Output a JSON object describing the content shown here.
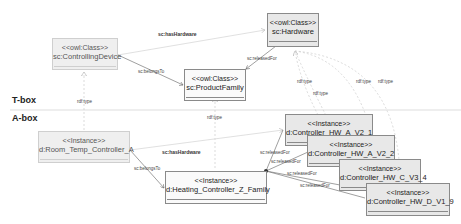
{
  "sections": {
    "tbox_label": "T-box",
    "abox_label": "A-box"
  },
  "tbox": {
    "classes": [
      {
        "id": "controlling_device",
        "stereotype": "<<owl:Class>>",
        "name": "sc:ControllingDevice"
      },
      {
        "id": "product_family",
        "stereotype": "<<owl:Class>>",
        "name": "sc:ProductFamily"
      },
      {
        "id": "hardware",
        "stereotype": "<<owl:Class>>",
        "name": "sc:Hardware"
      }
    ],
    "edges": [
      {
        "from": "controlling_device",
        "to": "hardware",
        "label": "sc:hasHardware"
      },
      {
        "from": "controlling_device",
        "to": "product_family",
        "label": "sc:belongsTo"
      },
      {
        "from": "hardware",
        "to": "product_family",
        "label": "sc:releasedFor"
      }
    ]
  },
  "abox": {
    "instances": [
      {
        "id": "room_temp",
        "stereotype": "<<Instance>>",
        "name": "d:Room_Temp_Controller_A"
      },
      {
        "id": "heating_family",
        "stereotype": "<<Instance>>",
        "name": "d:Heating_Controller_Z_Family"
      },
      {
        "id": "hw_a_v2_1",
        "stereotype": "<<Instance>>",
        "name": "d:Controller_HW_A_V2_1"
      },
      {
        "id": "hw_a_v2_2",
        "stereotype": "<<Instance>>",
        "name": "d:Controller_HW_A_V2_2"
      },
      {
        "id": "hw_c_v3_4",
        "stereotype": "<<Instance>>",
        "name": "d:Controller_HW_C_V3_4"
      },
      {
        "id": "hw_d_v1_9",
        "stereotype": "<<Instance>>",
        "name": "d:Controller_HW_D_V1_9"
      }
    ],
    "edges": [
      {
        "from": "room_temp",
        "to": "hw_a_v2_1",
        "label": "sc:hasHardware"
      },
      {
        "from": "room_temp",
        "to": "heating_family",
        "label": "sc:belongsTo"
      },
      {
        "from": "hw_a_v2_1",
        "to": "heating_family",
        "label": "sc:releasedFor"
      },
      {
        "from": "hw_a_v2_2",
        "to": "heating_family",
        "label": "sc:releasedFor"
      },
      {
        "from": "hw_c_v3_4",
        "to": "heating_family",
        "label": "sc:releasedFor"
      },
      {
        "from": "hw_d_v1_9",
        "to": "heating_family",
        "label": "sc:releasedFor"
      }
    ]
  },
  "type_edges": {
    "label": "rdf:type",
    "labels": [
      "rdf:type",
      "rdf:type",
      "rdf:type",
      "rdf:type",
      "rdf:type",
      "rdf:type"
    ]
  }
}
